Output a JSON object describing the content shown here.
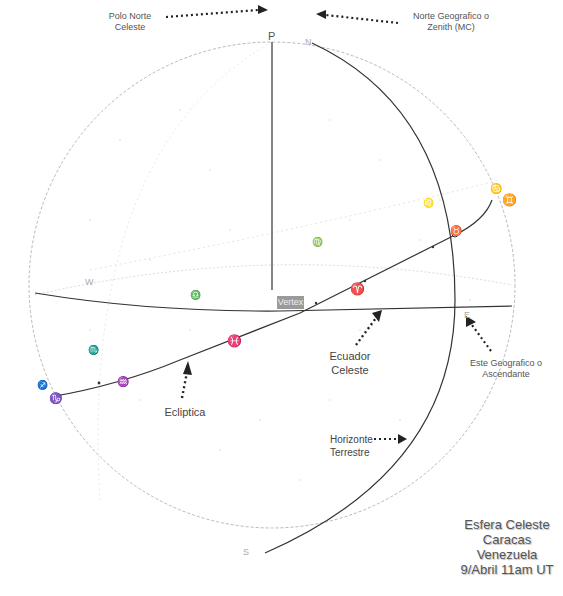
{
  "diagram": {
    "title_block": {
      "line1": "Esfera Celeste",
      "line2": "Caracas",
      "line3": "Venezuela",
      "line4": "9/Abril 11am UT"
    },
    "points": {
      "celestial_pole": "P",
      "north": "N",
      "south": "S",
      "west": "W",
      "east": "E"
    },
    "annotations": {
      "polo_norte": {
        "line1": "Polo Norte",
        "line2": "Celeste"
      },
      "norte_geografico": {
        "line1": "Norte Geografico o",
        "line2": "Zenith (MC)"
      },
      "este_geografico": {
        "line1": "Este Geografico o",
        "line2": "Ascendante"
      },
      "ecuador": {
        "line1": "Ecuador",
        "line2": "Celeste"
      },
      "ecliptica": {
        "line1": "Ecliptica"
      },
      "horizonte": {
        "line1": "Horizonte",
        "line2": "Terrestre"
      },
      "vertex": "Vertex"
    },
    "zodiac_symbols": {
      "cancer": "♋",
      "gemini": "♊",
      "taurus": "♉",
      "leo": "♌",
      "virgo": "♍",
      "libra": "♎",
      "scorpio": "♏",
      "sagittarius": "♐",
      "capricorn": "♑",
      "aquarius": "♒",
      "pisces": "♓",
      "aries": "♈"
    },
    "colors": {
      "sphere_outline": "#b0b0b0",
      "main_lines": "#333333",
      "arrows": "#222222",
      "text": "#555555",
      "vertex_box": "#9a9a9a"
    }
  }
}
